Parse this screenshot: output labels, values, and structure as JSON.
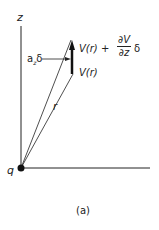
{
  "figure": {
    "axis_label_z": "z",
    "charge_label": "q",
    "position_label": "r",
    "displacement_label": "a",
    "displacement_sub": "z",
    "displacement_delta": "δ",
    "potential_lower": "V(r)",
    "potential_upper_prefix": "V(r) +",
    "partial_num": "∂V",
    "partial_den": "∂z",
    "partial_delta": "δ",
    "caption": "(a)"
  },
  "colors": {
    "ink": "#222222",
    "background": "#ffffff"
  }
}
